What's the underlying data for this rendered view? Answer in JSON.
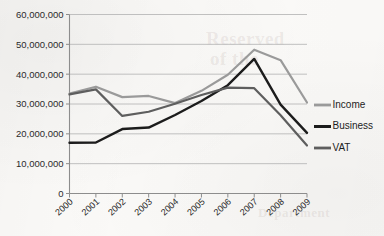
{
  "background_text": {
    "bleed_line_1": "Reserved",
    "bleed_line_2": "of the",
    "bleed_line_3": "Department"
  },
  "chart_data": {
    "type": "line",
    "title": "",
    "xlabel": "",
    "ylabel": "",
    "categories": [
      "2000",
      "2001",
      "2002",
      "2003",
      "2004",
      "2005",
      "2006",
      "2007",
      "2008",
      "2009"
    ],
    "ylim": [
      0,
      60000000
    ],
    "ytick_values": [
      0,
      10000000,
      20000000,
      30000000,
      40000000,
      50000000,
      60000000
    ],
    "ytick_labels": [
      "0",
      "10,000,000",
      "20,000,000",
      "30,000,000",
      "40,000,000",
      "50,000,000",
      "60,000,000"
    ],
    "grid": true,
    "legend_position": "right",
    "series": [
      {
        "name": "Income",
        "color": "#9a9a9a",
        "stroke_width": 2.2,
        "values": [
          33500000,
          35800000,
          32300000,
          32700000,
          30300000,
          34400000,
          39800000,
          48200000,
          44700000,
          30500000
        ]
      },
      {
        "name": "Business",
        "color": "#1c1c1c",
        "stroke_width": 2.4,
        "values": [
          17000000,
          17100000,
          21600000,
          22100000,
          26300000,
          31000000,
          36300000,
          45100000,
          29800000,
          20300000
        ]
      },
      {
        "name": "VAT",
        "color": "#5e5e5e",
        "stroke_width": 2.2,
        "values": [
          33200000,
          34900000,
          26000000,
          27400000,
          30100000,
          33000000,
          35500000,
          35300000,
          26200000,
          16100000
        ]
      }
    ]
  }
}
